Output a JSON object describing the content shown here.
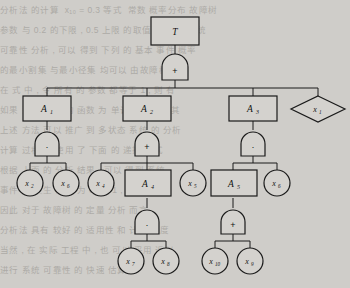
{
  "figure": {
    "type": "fault-tree",
    "background_note": "scanned textbook page with faint bleed-through text",
    "colors": {
      "ink": "#1a1a1a",
      "paper": "#cfcdc9",
      "node_fill": "#d4d2ce"
    }
  },
  "nodes": {
    "top": {
      "id": "T",
      "shape": "rect",
      "label": "T",
      "sub": ""
    },
    "a1": {
      "id": "A1",
      "shape": "rect",
      "label": "A",
      "sub": "1"
    },
    "a2": {
      "id": "A2",
      "shape": "rect",
      "label": "A",
      "sub": "2"
    },
    "a3": {
      "id": "A3",
      "shape": "rect",
      "label": "A",
      "sub": "3"
    },
    "a4": {
      "id": "A4",
      "shape": "rect",
      "label": "A",
      "sub": "4"
    },
    "a5": {
      "id": "A5",
      "shape": "rect",
      "label": "A",
      "sub": "5"
    },
    "x1": {
      "id": "x1",
      "shape": "diamond",
      "label": "x",
      "sub": "1"
    },
    "x2": {
      "id": "x2",
      "shape": "circle",
      "label": "x",
      "sub": "2"
    },
    "x6a": {
      "id": "x6",
      "shape": "circle",
      "label": "x",
      "sub": "6"
    },
    "x4": {
      "id": "x4",
      "shape": "circle",
      "label": "x",
      "sub": "4"
    },
    "x5": {
      "id": "x5",
      "shape": "circle",
      "label": "x",
      "sub": "5"
    },
    "x6b": {
      "id": "x6",
      "shape": "circle",
      "label": "x",
      "sub": "6"
    },
    "x7": {
      "id": "x7",
      "shape": "circle",
      "label": "x",
      "sub": "7"
    },
    "x8": {
      "id": "x8",
      "shape": "circle",
      "label": "x",
      "sub": "8"
    },
    "x10": {
      "id": "x10",
      "shape": "circle",
      "label": "x",
      "sub": "10"
    },
    "x9": {
      "id": "x9",
      "shape": "circle",
      "label": "x",
      "sub": "9"
    }
  },
  "gates": {
    "g_top": {
      "parent": "T",
      "symbol": "+",
      "type": "or"
    },
    "g_a1": {
      "parent": "A1",
      "symbol": "·",
      "type": "and"
    },
    "g_a2": {
      "parent": "A2",
      "symbol": "+",
      "type": "or"
    },
    "g_a3": {
      "parent": "A3",
      "symbol": "·",
      "type": "and"
    },
    "g_a4": {
      "parent": "A4",
      "symbol": "·",
      "type": "and"
    },
    "g_a5": {
      "parent": "A5",
      "symbol": "+",
      "type": "or"
    }
  },
  "edges": [
    {
      "from": "T",
      "to": "g_top"
    },
    {
      "from": "g_top",
      "to": "A1"
    },
    {
      "from": "g_top",
      "to": "A2"
    },
    {
      "from": "g_top",
      "to": "A3"
    },
    {
      "from": "g_top",
      "to": "x1"
    },
    {
      "from": "A1",
      "to": "g_a1"
    },
    {
      "from": "g_a1",
      "to": "x2"
    },
    {
      "from": "g_a1",
      "to": "x6"
    },
    {
      "from": "A2",
      "to": "g_a2"
    },
    {
      "from": "g_a2",
      "to": "x4"
    },
    {
      "from": "g_a2",
      "to": "A4"
    },
    {
      "from": "g_a2",
      "to": "x5"
    },
    {
      "from": "A3",
      "to": "g_a3"
    },
    {
      "from": "g_a3",
      "to": "A5"
    },
    {
      "from": "g_a3",
      "to": "x6"
    },
    {
      "from": "A4",
      "to": "g_a4"
    },
    {
      "from": "g_a4",
      "to": "x7"
    },
    {
      "from": "g_a4",
      "to": "x8"
    },
    {
      "from": "A5",
      "to": "g_a5"
    },
    {
      "from": "g_a5",
      "to": "x10"
    },
    {
      "from": "g_a5",
      "to": "x9"
    }
  ],
  "bleed_lines": [
    "分析法 的计算  x₁₀ = 0.3 等式  常数 概率分布 故障树",
    "参数 与 0.2 的下限 , 0.5 上限 的取值  计算出 系统",
    "可靠性 分析 , 可以 得到 下列 的 基本 事件 概率",
    "的最小割集 与最小径集 均可以 由故障树 得出",
    "在 式 中 , 令 所有 的 参数 都等于 1 , 则 有",
    "",
    "",
    "如果 系统 的 结构 函数 为 单调 的 , 那么 其",
    "上述 方法 可以 推广 到 多状态 系统 的 分析",
    "计算 过程 中 使用 了 下面 的 递推 公式",
    "",
    "根据 上面 的 分析 结果 , 可以 得到 系统",
    "事件 的 发生 概率 为 0.0271 , 其 中 最大",
    "因此 对于 故障树 的 定量 分析 而言 ,",
    "分析法 具有 较好 的 适用性 和 计算 精度",
    "",
    "当然 , 在 实际 工程 中 , 也 可以 采用 近似",
    "进行 系统 可靠性 的 快速 估算 。"
  ]
}
